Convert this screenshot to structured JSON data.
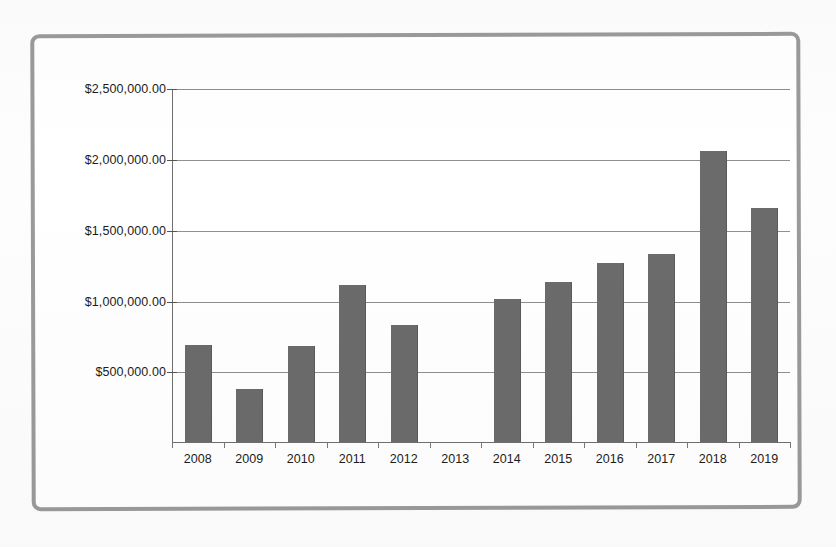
{
  "chart_data": {
    "type": "bar",
    "title": "",
    "xlabel": "",
    "ylabel": "",
    "categories": [
      "2008",
      "2009",
      "2010",
      "2011",
      "2012",
      "2013",
      "2014",
      "2015",
      "2016",
      "2017",
      "2018",
      "2019"
    ],
    "values": [
      690000,
      375000,
      685000,
      1120000,
      835000,
      0,
      1020000,
      1140000,
      1270000,
      1335000,
      2070000,
      1665000
    ],
    "series": [
      {
        "name": "Amount",
        "values": [
          690000,
          375000,
          685000,
          1120000,
          835000,
          0,
          1020000,
          1140000,
          1270000,
          1335000,
          2070000,
          1665000
        ]
      }
    ],
    "ylim": [
      0,
      2500000
    ],
    "y_tick_values": [
      500000,
      1000000,
      1500000,
      2000000,
      2500000
    ],
    "y_tick_labels": [
      "$500,000.00",
      "$1,000,000.00",
      "$1,500,000.00",
      "$2,000,000.00",
      "$2,500,000.00"
    ],
    "grid": true,
    "legend": "none",
    "bar_color": "#6b6b6b",
    "gridline_color": "#8f8f8f",
    "axis_color": "#6e6e6e",
    "frame_color": "#9a9a9a",
    "background_color": "#ffffff"
  }
}
